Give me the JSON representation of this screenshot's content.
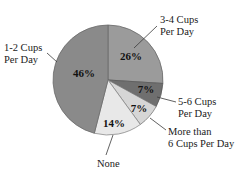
{
  "chart_data": {
    "type": "pie",
    "title": "",
    "subtitle": "",
    "xlabel": "",
    "ylabel": "",
    "legend_position": "none",
    "grid": false,
    "categories": [
      "3-4 Cups Per Day",
      "5-6 Cups Per Day",
      "More than 6 Cups Per Day",
      "None",
      "1-2 Cups Per Day"
    ],
    "values": [
      26,
      7,
      7,
      14,
      46
    ],
    "value_labels": [
      "26%",
      "7%",
      "7%",
      "14%",
      "46%"
    ],
    "colors": [
      "#9b9b9b",
      "#6f6f6f",
      "#d6d6d6",
      "#e8e8e8",
      "#8a8a8a"
    ],
    "slices": [
      {
        "label_line1": "3-4 Cups",
        "label_line2": "Per Day",
        "value": 26,
        "value_label": "26%",
        "color": "#9b9b9b"
      },
      {
        "label_line1": "5-6 Cups",
        "label_line2": "Per Day",
        "value": 7,
        "value_label": "7%",
        "color": "#6f6f6f"
      },
      {
        "label_line1": "More than",
        "label_line2": "6 Cups Per Day",
        "value": 7,
        "value_label": "7%",
        "color": "#d6d6d6"
      },
      {
        "label_line1": "None",
        "label_line2": "",
        "value": 14,
        "value_label": "14%",
        "color": "#e8e8e8"
      },
      {
        "label_line1": "1-2 Cups",
        "label_line2": "Per Day",
        "value": 46,
        "value_label": "46%",
        "color": "#8a8a8a"
      }
    ]
  },
  "style": {
    "background": "#ffffff",
    "outline": "#5a5a5a",
    "leader_line": "#3a3a3a",
    "text": "#1a1a1a"
  }
}
